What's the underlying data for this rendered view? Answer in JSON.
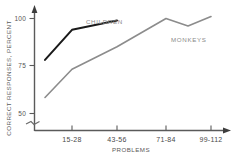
{
  "chart_data": {
    "type": "line",
    "title": "",
    "xlabel": "PROBLEMS",
    "ylabel": "CORRECT RESPONSES, PERCENT",
    "categories": [
      "15-28",
      "43-56",
      "71-84",
      "99-112"
    ],
    "xtick_labels": [
      "15-28",
      "43-56",
      "71-84",
      "99-112"
    ],
    "ytick_labels": [
      "100",
      "75",
      "50"
    ],
    "ytick_values": [
      100,
      75,
      50
    ],
    "ylim": [
      50,
      105
    ],
    "axis_break": true,
    "grid": false,
    "legend": "inline-annotations",
    "series": [
      {
        "name": "CHILDREN",
        "color": "#1a1a1a",
        "label_x": 86,
        "label_y": 24,
        "points": [
          {
            "x": 45,
            "y": 78
          },
          {
            "x": 72,
            "y": 94
          },
          {
            "x": 117,
            "y": 99
          }
        ]
      },
      {
        "name": "MONKEYS",
        "color": "#8c8c8c",
        "label_x": 171,
        "label_y": 42,
        "points": [
          {
            "x": 45,
            "y": 58
          },
          {
            "x": 72,
            "y": 73
          },
          {
            "x": 117,
            "y": 85
          },
          {
            "x": 166,
            "y": 100
          },
          {
            "x": 188,
            "y": 96
          },
          {
            "x": 211,
            "y": 101
          }
        ]
      }
    ]
  },
  "axes": {
    "y_label_text": "CORRECT RESPONSES, PERCENT",
    "x_label_text": "PROBLEMS",
    "y_tick_100": "100",
    "y_tick_75": "75",
    "y_tick_50": "50",
    "x_tick_1": "15-28",
    "x_tick_2": "43-56",
    "x_tick_3": "71-84",
    "x_tick_4": "99-112"
  },
  "annotations": {
    "children_label": "CHILDREN",
    "monkeys_label": "MONKEYS"
  },
  "colors": {
    "background": "#ffffff",
    "axis": "#555555",
    "children_line": "#1a1a1a",
    "monkeys_line": "#8c8c8c",
    "text": "#555555"
  }
}
